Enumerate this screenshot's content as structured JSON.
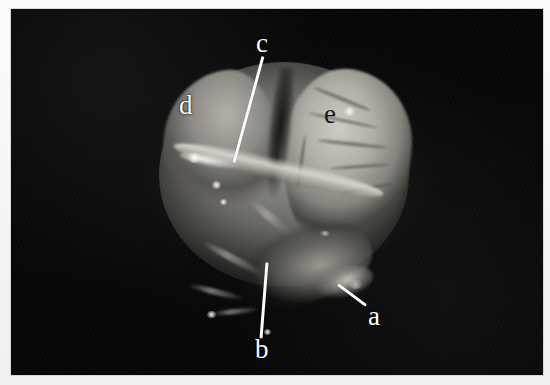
{
  "figure": {
    "type": "endoscopic-photograph",
    "caption": "",
    "background_color": "#070707",
    "frame_color": "#f2f2f2",
    "annotation_color": "#fdfdfb",
    "annotation_dark_color": "#121212",
    "width": 550,
    "height": 385
  },
  "annotations": [
    {
      "id": "a",
      "label": "a",
      "x": 368,
      "y": 303,
      "color": "#fdfdfb",
      "has_leader": true,
      "leader": {
        "x1": 338,
        "y1": 283,
        "x2": 366,
        "y2": 304
      }
    },
    {
      "id": "b",
      "label": "b",
      "x": 255,
      "y": 336,
      "color": "#fdfdfb",
      "has_leader": true,
      "leader": {
        "x1": 267,
        "y1": 261,
        "x2": 261,
        "y2": 337
      }
    },
    {
      "id": "c",
      "label": "c",
      "x": 256,
      "y": 30,
      "color": "#fdfdfb",
      "has_leader": true,
      "leader": {
        "x1": 263,
        "y1": 55,
        "x2": 234,
        "y2": 161
      }
    },
    {
      "id": "d",
      "label": "d",
      "x": 179,
      "y": 92,
      "color": "#fdfdfb",
      "has_leader": false,
      "leader": null
    },
    {
      "id": "e",
      "label": "e",
      "x": 324,
      "y": 101,
      "color": "#121212",
      "has_leader": false,
      "leader": null
    }
  ]
}
